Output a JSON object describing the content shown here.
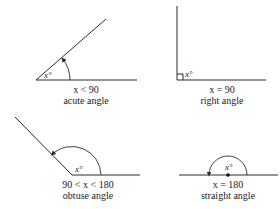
{
  "diagram": {
    "angles": [
      {
        "id": "acute",
        "angle_label": "x°",
        "condition": "x < 90",
        "name": "acute angle",
        "measure_deg": 38
      },
      {
        "id": "right",
        "angle_label": "x°",
        "condition": "x = 90",
        "name": "right angle",
        "measure_deg": 90
      },
      {
        "id": "obtuse",
        "angle_label": "x°",
        "condition": "90 < x < 180",
        "name": "obtuse angle",
        "measure_deg": 135
      },
      {
        "id": "straight",
        "angle_label": "x°",
        "condition": "x = 180",
        "name": "straight angle",
        "measure_deg": 180
      }
    ]
  }
}
